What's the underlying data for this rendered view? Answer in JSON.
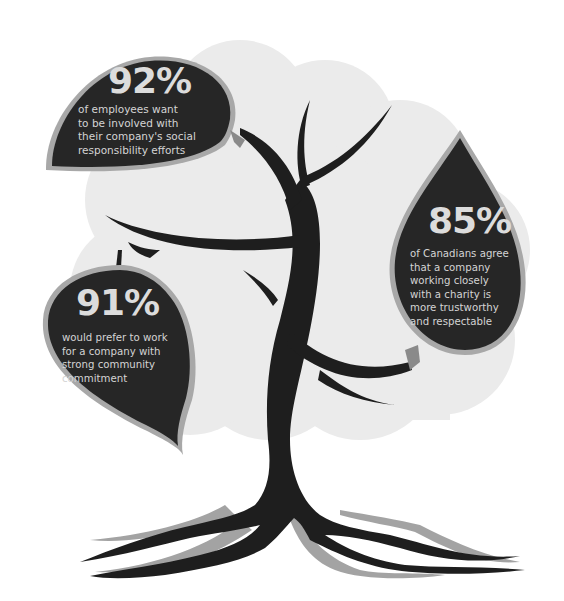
{
  "infographic": {
    "colors": {
      "background": "#ffffff",
      "cloud": "#ebebeb",
      "tree": "#1e1e1e",
      "leaf": "#262626",
      "leaf_outline": "#a8a8a8",
      "root_shadow": "#a0a0a0",
      "text": "#d9d9d9"
    },
    "stats": [
      {
        "value": "92%",
        "description": "of employees want\nto be involved with\ntheir company's social\nresponsibility efforts"
      },
      {
        "value": "85%",
        "description": "of Canadians agree\nthat a company\nworking closely\nwith a charity is\nmore trustworthy\nand respectable"
      },
      {
        "value": "91%",
        "description": "would prefer to work\nfor a company with\nstrong community\ncommitment"
      }
    ]
  }
}
